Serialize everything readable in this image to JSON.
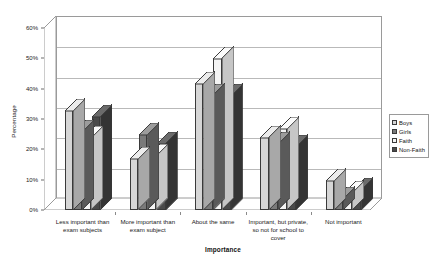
{
  "chart_data": {
    "type": "bar",
    "title": "",
    "xlabel": "Importance",
    "ylabel": "Percentage",
    "ylim": [
      0,
      60
    ],
    "ytick_labels": [
      "0%",
      "10%",
      "20%",
      "30%",
      "40%",
      "50%",
      "60%"
    ],
    "ytick_values": [
      0,
      10,
      20,
      30,
      40,
      50,
      60
    ],
    "grid": true,
    "legend_position": "right",
    "three_d": true,
    "categories": [
      "Less important than exam subjects",
      "More important than exam subject",
      "About the same",
      "Important, but private, so not for school to cover",
      "Not important"
    ],
    "category_lines": [
      [
        "Less important than",
        "exam subjects"
      ],
      [
        "More important than",
        "exam subject"
      ],
      [
        "About the same"
      ],
      [
        "Important, but private,",
        "so not for school to",
        "cover"
      ],
      [
        "Not important"
      ]
    ],
    "series": [
      {
        "name": "Boys",
        "color": "#d6d6d6",
        "side_color": "#a8a8a8",
        "top_color": "#ececec",
        "values": [
          33,
          17,
          42,
          24,
          10
        ]
      },
      {
        "name": "Girls",
        "color": "#7a7a7a",
        "side_color": "#5a5a5a",
        "top_color": "#9c9c9c",
        "values": [
          26,
          25,
          38,
          22,
          4
        ]
      },
      {
        "name": "Faith",
        "color": "#f4f4f4",
        "side_color": "#c6c6c6",
        "top_color": "#fbfbfb",
        "values": [
          24,
          18,
          50,
          27,
          6
        ]
      },
      {
        "name": "Non-Faith",
        "color": "#4a4a4a",
        "side_color": "#343434",
        "top_color": "#6b6b6b",
        "values": [
          31,
          22,
          38,
          21,
          7
        ]
      }
    ]
  },
  "legend": {
    "items": [
      {
        "label": "Boys"
      },
      {
        "label": "Girls"
      },
      {
        "label": "Faith"
      },
      {
        "label": "Non-Faith"
      }
    ]
  }
}
